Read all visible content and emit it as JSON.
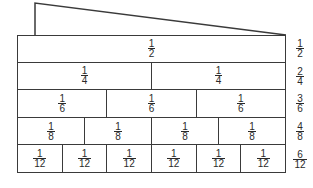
{
  "diagram": {
    "rows": [
      {
        "cells": [
          {
            "num": "1",
            "den": "2"
          }
        ],
        "equivalent": {
          "num": "1",
          "den": "2"
        }
      },
      {
        "cells": [
          {
            "num": "1",
            "den": "4"
          },
          {
            "num": "1",
            "den": "4"
          }
        ],
        "equivalent": {
          "num": "2",
          "den": "4"
        }
      },
      {
        "cells": [
          {
            "num": "1",
            "den": "6"
          },
          {
            "num": "1",
            "den": "6"
          },
          {
            "num": "1",
            "den": "6"
          }
        ],
        "equivalent": {
          "num": "3",
          "den": "6"
        }
      },
      {
        "cells": [
          {
            "num": "1",
            "den": "8"
          },
          {
            "num": "1",
            "den": "8"
          },
          {
            "num": "1",
            "den": "8"
          },
          {
            "num": "1",
            "den": "8"
          }
        ],
        "equivalent": {
          "num": "4",
          "den": "8"
        }
      },
      {
        "cells": [
          {
            "num": "1",
            "den": "12"
          },
          {
            "num": "1",
            "den": "12"
          },
          {
            "num": "1",
            "den": "12"
          },
          {
            "num": "1",
            "den": "12"
          },
          {
            "num": "1",
            "den": "12"
          },
          {
            "num": "1",
            "den": "12"
          }
        ],
        "equivalent": {
          "num": "6",
          "den": "12"
        }
      }
    ],
    "colors": {
      "line": "#3a3a3a",
      "text": "#2a2a2a",
      "background": "#ffffff"
    }
  }
}
